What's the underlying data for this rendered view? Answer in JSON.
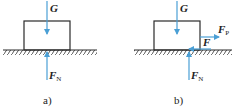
{
  "colors": {
    "force_arrow": "#4a9fd5",
    "outline": "#2a2a2a",
    "hatch": "#444444",
    "background": "#ffffff"
  },
  "panels": [
    {
      "id": "a",
      "caption": "a)",
      "labels": {
        "gravity": "G",
        "normal_main": "F",
        "normal_sub": "N"
      }
    },
    {
      "id": "b",
      "caption": "b)",
      "labels": {
        "gravity": "G",
        "push_main": "F",
        "push_sub": "P",
        "friction": "F",
        "normal_main": "F",
        "normal_sub": "N"
      }
    }
  ]
}
